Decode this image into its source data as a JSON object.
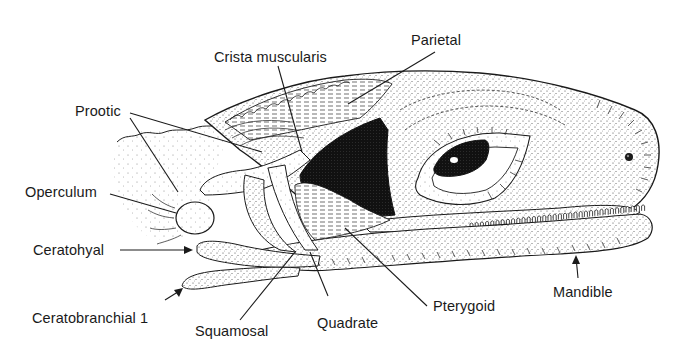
{
  "figure": {
    "style": "stippled pen-and-ink illustration"
  },
  "labels": {
    "parietal": "Parietal",
    "crista_muscularis": "Crista muscularis",
    "prootic": "Prootic",
    "operculum": "Operculum",
    "ceratohyal": "Ceratohyal",
    "ceratobranchial": "Ceratobranchial  1",
    "squamosal": "Squamosal",
    "quadrate": "Quadrate",
    "pterygoid": "Pterygoid",
    "mandible": "Mandible"
  },
  "colors": {
    "ink": "#1a1a1a",
    "paper": "#ffffff",
    "stipple": "#555555"
  }
}
